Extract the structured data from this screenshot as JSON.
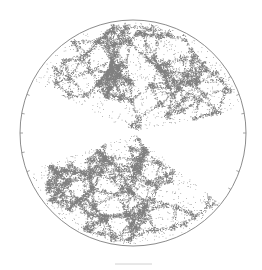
{
  "figure": {
    "background": "#ffffff",
    "ring_color": "#8c8c8c",
    "dot_color": "#555555",
    "center": [
      133,
      133
    ],
    "radius": 113,
    "wedges": [
      {
        "name": "north",
        "start_deg": 12,
        "end_deg": 152,
        "density": 1.0
      },
      {
        "name": "south",
        "start_deg": 200,
        "end_deg": 321,
        "density": 1.0
      }
    ],
    "tick_angles_deg": [
      0,
      10,
      20,
      30,
      160,
      170,
      180,
      190,
      200,
      330,
      340
    ],
    "scale_bar": {
      "x1": 115,
      "x2": 152,
      "y": 264,
      "color": "#d0d0d0"
    }
  }
}
